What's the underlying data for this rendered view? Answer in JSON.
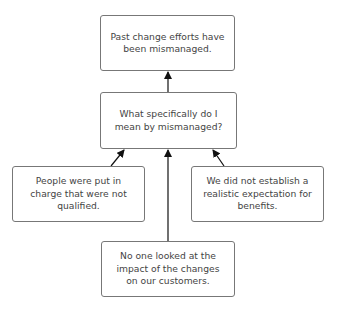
{
  "diagram": {
    "top_caption_clipped": "",
    "nodes": {
      "root": "Past change efforts have been mismanaged.",
      "question": "What specifically do I mean by mismanaged?",
      "left": "People were put in charge that were not qualified.",
      "right": "We did not establish a realistic expectation for benefits.",
      "bottom": "No one looked at the impact of the changes on our customers."
    },
    "edges": [
      {
        "from": "question",
        "to": "root"
      },
      {
        "from": "left",
        "to": "question"
      },
      {
        "from": "right",
        "to": "question"
      },
      {
        "from": "bottom",
        "to": "question"
      }
    ]
  }
}
